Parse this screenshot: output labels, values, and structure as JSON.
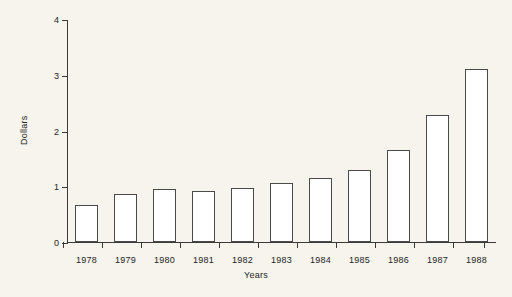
{
  "chart_data": {
    "type": "bar",
    "title": "",
    "subtitle": "",
    "xlabel": "Years",
    "ylabel": "Dollars",
    "categories": [
      "1978",
      "1979",
      "1980",
      "1981",
      "1982",
      "1983",
      "1984",
      "1985",
      "1986",
      "1987",
      "1988"
    ],
    "values": [
      0.66,
      0.87,
      0.95,
      0.92,
      0.97,
      1.06,
      1.15,
      1.3,
      1.65,
      2.27,
      3.1
    ],
    "ylim": [
      0,
      4
    ],
    "ytick_labels": [
      "0",
      "1",
      "2",
      "3",
      "4"
    ],
    "ytick_values": [
      0,
      1,
      2,
      3,
      4
    ],
    "grid": false,
    "legend": false,
    "legend_position": "none",
    "bar_face_color": "#ffffff",
    "bar_edge_color": "#4a4a4a",
    "axis_color": "#3a3a3a",
    "background_color": "#f6f4ed",
    "text_color": "#242424",
    "annotations": []
  }
}
